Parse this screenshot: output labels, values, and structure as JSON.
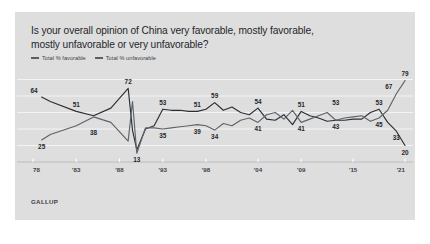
{
  "card": {
    "background": "#dedede",
    "title": "Is your overall opinion of China very favorable, mostly favorable, mostly unfavorable or very unfavorable?",
    "title_line1": "Is your overall opinion of China very favorable, mostly favorable,",
    "title_line2": "mostly unfavorable or very unfavorable?",
    "source": "GALLUP"
  },
  "legend": {
    "position": "top-left",
    "items": [
      {
        "label": "Total % favorable",
        "color": "#2b2f35"
      },
      {
        "label": "Total % unfavorable",
        "color": "#5e646c"
      }
    ]
  },
  "chart_data": {
    "type": "line",
    "title": "Is your overall opinion of China very favorable, mostly favorable, mostly unfavorable or very unfavorable?",
    "xlabel": "",
    "ylabel": "",
    "xlim": [
      1978,
      2021
    ],
    "ylim": [
      5,
      85
    ],
    "grid": true,
    "legend_position": "top-left",
    "xticks": [
      1978,
      1983,
      1988,
      1993,
      1998,
      2004,
      2009,
      2015,
      2021
    ],
    "xtick_labels": [
      "78",
      "'83",
      "'88",
      "'93",
      "'98",
      "'04",
      "'09",
      "'15",
      "'21"
    ],
    "series": [
      {
        "name": "Total % favorable",
        "color": "#2b2f35",
        "x": [
          1979,
          1980,
          1983,
          1985,
          1987,
          1989,
          1989.5,
          1990,
          1991,
          1992,
          1993,
          1994,
          1995,
          1996,
          1997,
          1998,
          1999,
          2000,
          2001,
          2002,
          2003,
          2004,
          2005,
          2006,
          2007,
          2008,
          2009,
          2010,
          2011,
          2012,
          2013,
          2014,
          2015,
          2016,
          2017,
          2018,
          2019,
          2020,
          2021
        ],
        "y": [
          64,
          60,
          51,
          47,
          54,
          72,
          34,
          16,
          35,
          38,
          53,
          52,
          52,
          51,
          51,
          53,
          59,
          52,
          55,
          50,
          48,
          54,
          44,
          43,
          48,
          39,
          51,
          47,
          45,
          42,
          43,
          43,
          44,
          44,
          50,
          53,
          41,
          33,
          20
        ],
        "labels": [
          {
            "x": 1979,
            "y": 64,
            "text": "64",
            "position": "above-left"
          },
          {
            "x": 1983,
            "y": 51,
            "text": "51",
            "position": "above"
          },
          {
            "x": 1989,
            "y": 72,
            "text": "72",
            "position": "above"
          },
          {
            "x": 1993,
            "y": 53,
            "text": "53",
            "position": "above"
          },
          {
            "x": 1997,
            "y": 51,
            "text": "51",
            "position": "above"
          },
          {
            "x": 1999,
            "y": 59,
            "text": "59",
            "position": "above"
          },
          {
            "x": 2004,
            "y": 54,
            "text": "54",
            "position": "above"
          },
          {
            "x": 2009,
            "y": 51,
            "text": "51",
            "position": "above"
          },
          {
            "x": 2013,
            "y": 53,
            "text": "53",
            "position": "above"
          },
          {
            "x": 2018,
            "y": 53,
            "text": "53",
            "position": "above"
          },
          {
            "x": 2020,
            "y": 33,
            "text": "33",
            "position": "below"
          },
          {
            "x": 2021,
            "y": 20,
            "text": "20",
            "position": "below"
          }
        ]
      },
      {
        "name": "Total % unfavorable",
        "color": "#5e646c",
        "x": [
          1979,
          1980,
          1983,
          1985,
          1987,
          1989,
          1989.5,
          1990,
          1991,
          1992,
          1993,
          1994,
          1995,
          1996,
          1997,
          1998,
          1999,
          2000,
          2001,
          2002,
          2003,
          2004,
          2005,
          2006,
          2007,
          2008,
          2009,
          2010,
          2011,
          2012,
          2013,
          2014,
          2015,
          2016,
          2017,
          2018,
          2019,
          2020,
          2021
        ],
        "y": [
          25,
          30,
          38,
          46,
          41,
          24,
          60,
          13,
          36,
          36,
          35,
          36,
          37,
          38,
          39,
          38,
          34,
          40,
          38,
          43,
          45,
          41,
          48,
          50,
          44,
          52,
          41,
          44,
          47,
          50,
          43,
          45,
          46,
          47,
          42,
          45,
          52,
          67,
          79
        ],
        "labels": [
          {
            "x": 1979,
            "y": 25,
            "text": "25",
            "position": "below"
          },
          {
            "x": 1985,
            "y": 38,
            "text": "38",
            "position": "below"
          },
          {
            "x": 1990,
            "y": 13,
            "text": "13",
            "position": "below"
          },
          {
            "x": 1993,
            "y": 35,
            "text": "35",
            "position": "below"
          },
          {
            "x": 1997,
            "y": 39,
            "text": "39",
            "position": "below"
          },
          {
            "x": 1999,
            "y": 34,
            "text": "34",
            "position": "below"
          },
          {
            "x": 2004,
            "y": 41,
            "text": "41",
            "position": "below"
          },
          {
            "x": 2009,
            "y": 41,
            "text": "41",
            "position": "below"
          },
          {
            "x": 2013,
            "y": 43,
            "text": "43",
            "position": "below"
          },
          {
            "x": 2018,
            "y": 45,
            "text": "45",
            "position": "below"
          },
          {
            "x": 2020,
            "y": 67,
            "text": "67",
            "position": "above-left"
          },
          {
            "x": 2021,
            "y": 79,
            "text": "79",
            "position": "above"
          }
        ]
      }
    ],
    "gridline_values": [
      20,
      35,
      50,
      65,
      80
    ]
  }
}
